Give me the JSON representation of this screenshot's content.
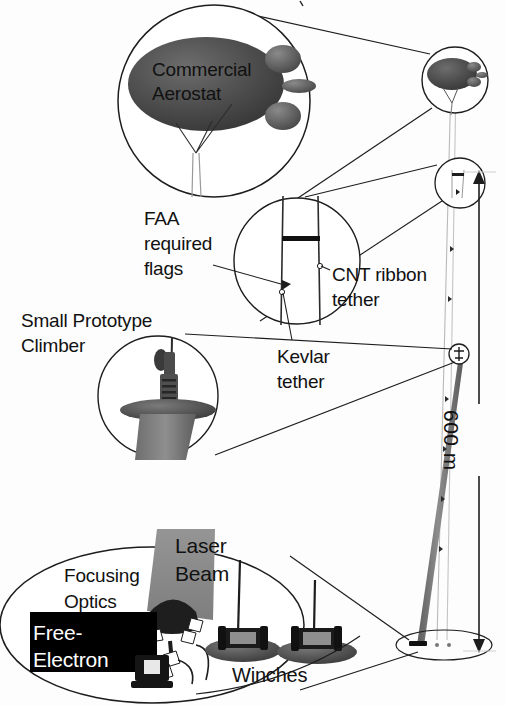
{
  "figure": {
    "background_color": "#fdfdfd",
    "ink_color": "#111111",
    "aerostat_fill": "#4a4a4a",
    "beam_fill": "#8d8d8d",
    "tether_fill": "#7b7b7b",
    "panel_fill": "#000000",
    "panel_text_color": "#ffffff"
  },
  "labels": {
    "commercial_aerostat": "Commercial\nAerostat",
    "faa_required_flags": "FAA\nrequired\nflags",
    "small_prototype_climber": "Small Prototype\nClimber",
    "cnt_ribbon_tether": "CNT ribbon\ntether",
    "kevlar_tether": "Kevlar\ntether",
    "focusing_optics": "Focusing\nOptics",
    "laser_beam": "Laser\nBeam",
    "free_electron": "Free-\nElectron",
    "winches": "Winches",
    "altitude": "600 m"
  },
  "callouts": [
    {
      "name": "aerostat-detail",
      "target": "Commercial Aerostat at top of tether"
    },
    {
      "name": "flag-detail",
      "target": "FAA required flags on tether"
    },
    {
      "name": "climber-detail",
      "target": "Small Prototype Climber on tether"
    },
    {
      "name": "ground-detail",
      "target": "Ground station: laser, optics, winches"
    }
  ],
  "dimension": {
    "value": "600 m",
    "arrow": "double-headed-vertical"
  },
  "icons": {
    "aerostat": "blimp-icon",
    "flag": "flag-icon",
    "climber": "climber-icon",
    "winch": "winch-icon",
    "laser": "laser-icon",
    "optics": "parabolic-mirror-icon",
    "computer": "computer-icon",
    "dimension_arrow": "double-arrow-icon"
  }
}
